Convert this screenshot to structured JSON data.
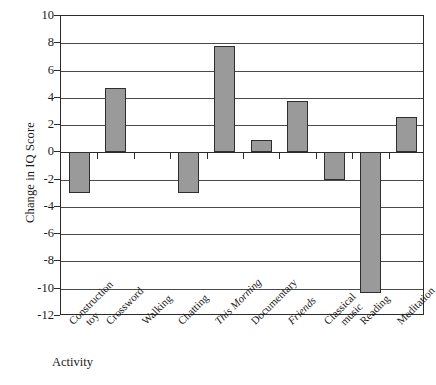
{
  "chart_data": {
    "type": "bar",
    "title": "",
    "xlabel": "Activity",
    "ylabel": "Change in IQ Score",
    "categories": [
      "Construction toy",
      "Crossword",
      "Walking",
      "Chatting",
      "This Morning",
      "Documentary",
      "Friends",
      "Classical music",
      "Reading",
      "Meditation"
    ],
    "category_lines": [
      [
        "Construction",
        "toy"
      ],
      [
        "Crossword"
      ],
      [
        "Walking"
      ],
      [
        "Chatting"
      ],
      [
        "This Morning"
      ],
      [
        "Documentary"
      ],
      [
        "Friends"
      ],
      [
        "Classical",
        "music"
      ],
      [
        "Reading"
      ],
      [
        "Meditation"
      ]
    ],
    "category_italic": [
      false,
      false,
      false,
      false,
      true,
      false,
      true,
      false,
      false,
      false
    ],
    "values": [
      -3.0,
      4.7,
      0.0,
      -3.0,
      7.8,
      0.9,
      3.8,
      -2.0,
      -10.3,
      2.6
    ],
    "ylim": [
      -12,
      10
    ],
    "yticks": [
      10,
      8,
      6,
      4,
      2,
      0,
      -2,
      -4,
      -6,
      -8,
      -10,
      -12
    ],
    "ytick_labels": [
      "10",
      "8",
      "6",
      "4",
      "2",
      "0",
      "-2",
      "-4",
      "-6",
      "-8",
      "-10",
      "-12"
    ],
    "grid": true,
    "legend": null,
    "bar_color": "#9a9a9a",
    "bar_edge_color": "#2e2e2e",
    "axis_color": "#2b2b2b"
  }
}
